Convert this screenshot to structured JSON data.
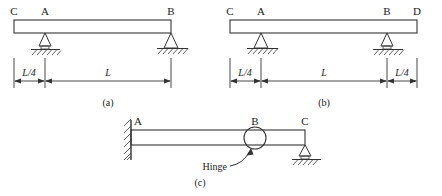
{
  "figure": {
    "type": "structural-beam-diagrams",
    "panels": [
      {
        "id": "a",
        "caption": "(a)",
        "node_labels": [
          "C",
          "A",
          "B"
        ],
        "supports": [
          {
            "at": "A",
            "kind": "pin-triangle-on-hatched-ground"
          },
          {
            "at": "B",
            "kind": "pin-triangle-on-hatched-ground"
          }
        ],
        "dimensions": [
          {
            "label": "L/4",
            "span": "C-to-A"
          },
          {
            "label": "L",
            "span": "A-to-B"
          }
        ]
      },
      {
        "id": "b",
        "caption": "(b)",
        "node_labels": [
          "C",
          "A",
          "B",
          "D"
        ],
        "supports": [
          {
            "at": "A",
            "kind": "pin-triangle-on-hatched-ground"
          },
          {
            "at": "B",
            "kind": "pin-triangle-on-hatched-ground"
          }
        ],
        "dimensions": [
          {
            "label": "L/4",
            "span": "C-to-A"
          },
          {
            "label": "L",
            "span": "A-to-B"
          },
          {
            "label": "L/4",
            "span": "B-to-D"
          }
        ]
      },
      {
        "id": "c",
        "caption": "(c)",
        "node_labels": [
          "A",
          "B",
          "C"
        ],
        "supports": [
          {
            "at": "A",
            "kind": "fixed-wall-hatched"
          },
          {
            "at": "C",
            "kind": "pin-triangle-on-hatched-ground"
          }
        ],
        "annotations": [
          {
            "text": "Hinge",
            "points_to": "B",
            "marker": "circle-on-beam"
          }
        ]
      }
    ]
  },
  "colors": {
    "line": "#333333",
    "text": "#1a1a1a",
    "background": "#ffffff"
  }
}
